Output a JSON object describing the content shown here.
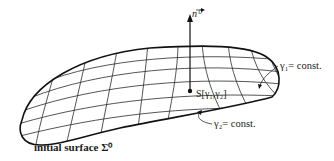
{
  "diagram": {
    "type": "parametrized surface with coordinate grid",
    "labels": {
      "normal_vector": "n⁰",
      "point": "S[γ₁,γ₂]",
      "gamma1_curve": "γ₁= const.",
      "gamma2_curve": "γ₂= const.",
      "surface": "initial surface Σ⁰"
    },
    "colors": {
      "ink": "#1a1a1a",
      "background": "#ffffff"
    }
  }
}
